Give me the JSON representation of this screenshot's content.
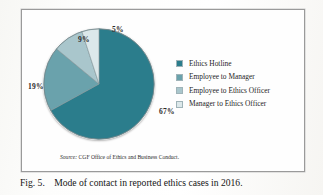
{
  "figure": {
    "caption_number": "Fig. 5.",
    "caption_text": "Mode of contact in reported ethics cases in 2016.",
    "source_prefix": "Source:",
    "source_text": "CGF Office of Ethics and Business Conduct."
  },
  "colors": {
    "slice_1": "#2b7d8c",
    "slice_2": "#6aa2ac",
    "slice_3": "#a9c6cc",
    "slice_4": "#dce8ea",
    "frame_border": "#9a9a9a",
    "label_text": "#2b2b2b",
    "page_background": "#fdfdfb"
  },
  "labels": {
    "pct_1": "67%",
    "pct_2": "19%",
    "pct_3": "9%",
    "pct_4": "5%"
  },
  "legend": {
    "items": [
      {
        "label": "Ethics Hotline",
        "color": "#2b7d8c"
      },
      {
        "label": "Employee to Manager",
        "color": "#6aa2ac"
      },
      {
        "label": "Employee to Ethics Officer",
        "color": "#a9c6cc"
      },
      {
        "label": "Manager to Ethics Officer",
        "color": "#dce8ea"
      }
    ]
  },
  "chart_data": {
    "type": "pie",
    "title": "Mode of contact in reported ethics cases in 2016.",
    "categories": [
      "Ethics Hotline",
      "Employee to Manager",
      "Employee to Ethics Officer",
      "Manager to Ethics Officer"
    ],
    "values": [
      67,
      19,
      9,
      5
    ],
    "value_labels": [
      "67%",
      "19%",
      "9%",
      "5%"
    ],
    "units": "percent",
    "colors": [
      "#2b7d8c",
      "#6aa2ac",
      "#a9c6cc",
      "#dce8ea"
    ],
    "start_angle_deg": 0,
    "direction": "clockwise",
    "legend_position": "right",
    "grid": false,
    "source_note": "Source: CGF Office of Ethics and Business Conduct."
  }
}
